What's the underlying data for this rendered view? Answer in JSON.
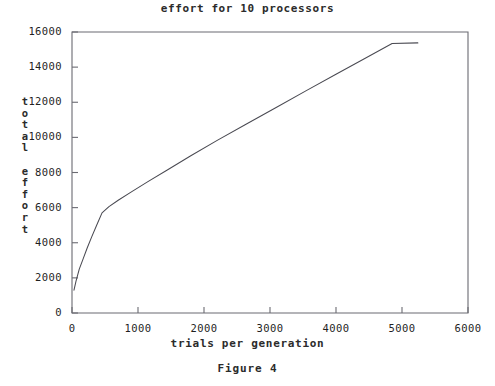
{
  "figure": {
    "caption": "Figure 4"
  },
  "chart_data": {
    "type": "line",
    "title": "effort for 10 processors",
    "xlabel": "trials per generation",
    "ylabel": "total effort",
    "ylabel_chars": [
      "t",
      "o",
      "t",
      "a",
      "l",
      " ",
      "e",
      "f",
      "f",
      "o",
      "r",
      "t"
    ],
    "xlim": [
      0,
      6000
    ],
    "ylim": [
      0,
      16000
    ],
    "xticks": [
      0,
      1000,
      2000,
      3000,
      4000,
      5000,
      6000
    ],
    "xtick_labels": [
      "0",
      "1000",
      "2000",
      "3000",
      "4000",
      "5000",
      "6000"
    ],
    "yticks": [
      0,
      2000,
      4000,
      6000,
      8000,
      10000,
      12000,
      14000,
      16000
    ],
    "ytick_labels": [
      "0",
      "2000",
      "4000",
      "6000",
      "8000",
      "10000",
      "12000",
      "14000",
      "16000"
    ],
    "grid": false,
    "legend": null,
    "line_color": "#4a4a52",
    "frame_color": "#6b6b72",
    "series": [
      {
        "name": "total effort",
        "x": [
          30,
          60,
          110,
          170,
          230,
          300,
          380,
          455,
          560,
          700,
          900,
          1150,
          1450,
          1800,
          2200,
          2650,
          3100,
          3550,
          4000,
          4450,
          4850,
          5240
        ],
        "y": [
          1300,
          1800,
          2500,
          3100,
          3700,
          4350,
          5050,
          5700,
          6060,
          6420,
          6900,
          7480,
          8160,
          8950,
          9830,
          10780,
          11720,
          12660,
          13590,
          14520,
          15350,
          15380
        ]
      }
    ]
  }
}
